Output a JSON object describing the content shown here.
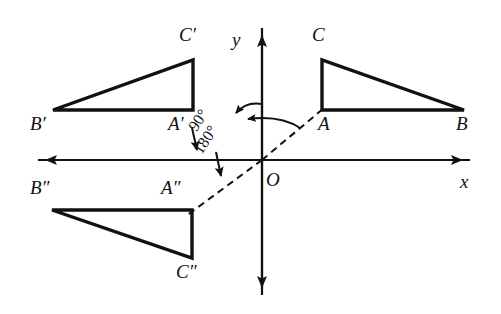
{
  "figure": {
    "type": "geometry-diagram",
    "width": 501,
    "height": 314,
    "background_color": "#ffffff",
    "stroke_color": "#111111"
  },
  "axes": {
    "x_label": "x",
    "y_label": "y",
    "origin_label": "O",
    "origin_px": {
      "x": 262,
      "y": 160
    },
    "x_axis_px": {
      "x1": 38,
      "y1": 160,
      "x2": 470,
      "y2": 160
    },
    "y_axis_px": {
      "x1": 262,
      "y1": 295,
      "x2": 262,
      "y2": 28
    },
    "x_label_pos": {
      "x": 461,
      "y": 172
    },
    "y_label_pos": {
      "x": 232,
      "y": 30
    },
    "origin_label_pos": {
      "x": 266,
      "y": 170
    }
  },
  "angles": [
    {
      "name": "angle-90",
      "text": "90°",
      "pos": {
        "x": 199,
        "y": 118
      }
    },
    {
      "name": "angle-180",
      "text": "180°",
      "pos": {
        "x": 204,
        "y": 141
      }
    }
  ],
  "triangles": [
    {
      "name": "triangle-abc",
      "id": "abc",
      "style": "solid",
      "vertices": [
        {
          "label": "A",
          "x": 322,
          "y": 110,
          "label_x": 318,
          "label_y": 116
        },
        {
          "label": "B",
          "x": 464,
          "y": 110,
          "label_x": 456,
          "label_y": 116
        },
        {
          "label": "C",
          "x": 322,
          "y": 60,
          "label_x": 313,
          "label_y": 27
        }
      ]
    },
    {
      "name": "triangle-a-prime-b-prime-c-prime",
      "id": "abc-prime",
      "style": "solid",
      "vertices": [
        {
          "label": "A′",
          "x": 193,
          "y": 110,
          "label_x": 170,
          "label_y": 116
        },
        {
          "label": "B′",
          "x": 53,
          "y": 110,
          "label_x": 32,
          "label_y": 116
        },
        {
          "label": "C′",
          "x": 193,
          "y": 60,
          "label_x": 180,
          "label_y": 27
        }
      ]
    },
    {
      "name": "triangle-a-dprime-b-dprime-c-dprime",
      "id": "abc-dprime",
      "style": "solid",
      "vertices": [
        {
          "label": "A″",
          "x": 192,
          "y": 210,
          "label_x": 163,
          "label_y": 180
        },
        {
          "label": "B″",
          "x": 52,
          "y": 210,
          "label_x": 32,
          "label_y": 180
        },
        {
          "label": "C″",
          "x": 192,
          "y": 258,
          "label_x": 178,
          "label_y": 262
        }
      ]
    }
  ],
  "dashed_rays": [
    {
      "name": "ray-o-to-a",
      "x1": 262,
      "y1": 160,
      "x2": 322,
      "y2": 110
    },
    {
      "name": "ray-o-to-a-dprime",
      "x1": 262,
      "y1": 160,
      "x2": 186,
      "y2": 215
    }
  ],
  "rotation_arrows": [
    {
      "name": "arrow-90-to-a-prime",
      "from": {
        "x": 193,
        "y": 128
      },
      "to": {
        "x": 198,
        "y": 156
      }
    },
    {
      "name": "arrow-180-to-a-dprime",
      "from": {
        "x": 216,
        "y": 152
      },
      "to": {
        "x": 221,
        "y": 182
      }
    }
  ],
  "arcs": [
    {
      "name": "arc-90",
      "description": "arc from y-axis top curving left toward A-prime direction"
    },
    {
      "name": "arc-180",
      "description": "arc from ray OA curving left across the y-axis"
    }
  ]
}
